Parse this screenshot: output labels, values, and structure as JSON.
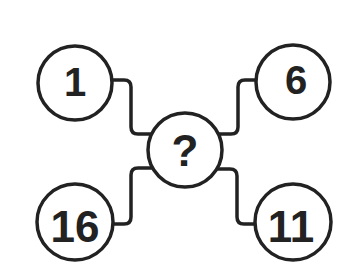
{
  "puzzle": {
    "type": "number-connection-puzzle",
    "center": {
      "label": "?",
      "cx": 185,
      "cy": 150,
      "r": 37,
      "font_size": 44
    },
    "nodes": [
      {
        "id": "top-left",
        "label": "1",
        "cx": 75,
        "cy": 83,
        "r": 37,
        "font_size": 40
      },
      {
        "id": "top-right",
        "label": "6",
        "cx": 293,
        "cy": 82,
        "r": 37,
        "font_size": 40
      },
      {
        "id": "bottom-left",
        "label": "16",
        "cx": 75,
        "cy": 222,
        "r": 38,
        "font_size": 44
      },
      {
        "id": "bottom-right",
        "label": "11",
        "cx": 293,
        "cy": 222,
        "r": 38,
        "font_size": 44
      }
    ],
    "connectors": [
      {
        "id": "connector-top-left",
        "d": "M 112 80 L 124 80 Q 131 80 131 87 L 131 127 Q 131 134 138 134 L 152 134"
      },
      {
        "id": "connector-top-right",
        "d": "M 218 134 L 231 134 Q 238 134 238 127 L 238 87 Q 238 80 245 80 L 256 80"
      },
      {
        "id": "connector-bottom-left",
        "d": "M 152 168 L 138 168 Q 131 168 131 175 L 131 217 Q 131 224 124 224 L 113 224"
      },
      {
        "id": "connector-bottom-right",
        "d": "M 218 169 L 230 169 Q 237 169 237 176 L 237 217 Q 237 224 244 224 L 255 224"
      }
    ],
    "colors": {
      "stroke": "#222222",
      "text": "#222222",
      "background": "#ffffff"
    }
  }
}
